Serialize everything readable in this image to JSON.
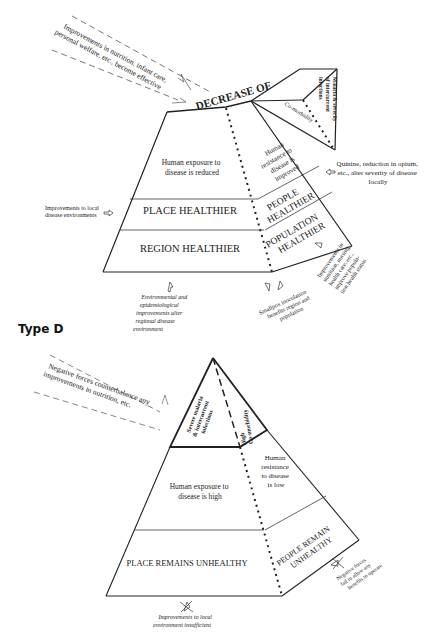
{
  "figure": {
    "type_c": {
      "top_arrow_label": [
        "Improvements in nutrition, infant care,",
        "personal welfare, etc., become effective"
      ],
      "apex_label": "DECREASE OF",
      "comorbidity_label": "Co-morbidity",
      "malaria_label": [
        "Malaria & severity",
        "of intercurrent",
        "infections"
      ],
      "exposure_label": [
        "Human exposure to",
        "disease is reduced"
      ],
      "resistance_label": [
        "Human",
        "resistance to",
        "disease is",
        "improved"
      ],
      "place_label": "PLACE HEALTHIER",
      "region_label": "REGION HEALTHIER",
      "people_label": [
        "PEOPLE",
        "HEALTHIER"
      ],
      "population_label": [
        "POPULATION",
        "HEALTHIER"
      ],
      "left_input": [
        "Improvements to local",
        "disease environments"
      ],
      "right_input": [
        "Quinine, reduction in opium,",
        "etc., alter severity of disease",
        "locally"
      ],
      "bottom_input_env": [
        "Environmental and",
        "epidemiological",
        "improvements alter",
        "regional disease",
        "environment"
      ],
      "bottom_input_smallpox": [
        "Smallpox inoculation",
        "benefits region and",
        "population"
      ],
      "bottom_input_nutrition": [
        "Improvements in",
        "nutrition, nursing,",
        "health care, etc.,",
        "improve popula-",
        "tion health status"
      ]
    },
    "type_d": {
      "heading": "Type D",
      "top_arrow_label": [
        "Negative forces counterbalance any",
        "improvements in nutrition, etc."
      ],
      "apex_left_label": [
        "Severe malaria",
        "& intercurrent",
        "infections"
      ],
      "apex_right_label": [
        "High",
        "Co-morbidity"
      ],
      "exposure_label": [
        "Human exposure to",
        "disease is high"
      ],
      "resistance_label": [
        "Human",
        "resistance",
        "to disease",
        "is low"
      ],
      "place_label": "PLACE REMAINS UNHEALTHY",
      "people_label": [
        "PEOPLE REMAIN",
        "UNHEALTHY"
      ],
      "bottom_input": [
        "Improvements to local",
        "environment insufficient"
      ],
      "right_input": [
        "Negative forces",
        "fail to allow any",
        "benefits to operate"
      ]
    }
  }
}
